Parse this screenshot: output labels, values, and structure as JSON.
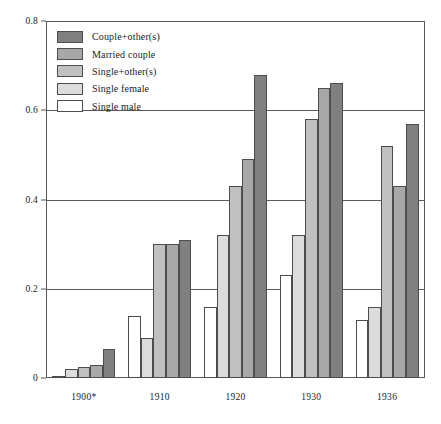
{
  "chart_data": {
    "type": "bar",
    "title": "",
    "subtitle": "",
    "xlabel": "",
    "ylabel": "",
    "categories": [
      "1900*",
      "1910",
      "1920",
      "1930",
      "1936"
    ],
    "ylim": [
      0,
      0.8
    ],
    "yticks": [
      0,
      0.2,
      0.4,
      0.6,
      0.8
    ],
    "ytick_labels": [
      "0",
      "0.2",
      "0.4",
      "0.6",
      "0.8"
    ],
    "grid": true,
    "legend_position": "top-left",
    "series": [
      {
        "name": "Single male",
        "color": "#ffffff",
        "values": [
          0.005,
          0.14,
          0.16,
          0.23,
          0.13
        ]
      },
      {
        "name": "Single female",
        "color": "#dcdcdc",
        "values": [
          0.02,
          0.09,
          0.32,
          0.32,
          0.16
        ]
      },
      {
        "name": "Single+other(s)",
        "color": "#c0c0c0",
        "values": [
          0.025,
          0.3,
          0.43,
          0.58,
          0.52
        ]
      },
      {
        "name": "Married couple",
        "color": "#a8a8a8",
        "values": [
          0.03,
          0.3,
          0.49,
          0.65,
          0.43
        ]
      },
      {
        "name": "Couple+other(s)",
        "color": "#808080",
        "values": [
          0.065,
          0.31,
          0.68,
          0.66,
          0.57
        ]
      }
    ],
    "legend_entries": [
      {
        "label": "Couple+other(s)",
        "color": "#808080"
      },
      {
        "label": "Married couple",
        "color": "#a8a8a8"
      },
      {
        "label": "Single+other(s)",
        "color": "#c0c0c0"
      },
      {
        "label": "Single female",
        "color": "#dcdcdc"
      },
      {
        "label": "Single male",
        "color": "#ffffff"
      }
    ],
    "axis_color": "#595959",
    "bar_edge_color": "#4d4d4d"
  }
}
